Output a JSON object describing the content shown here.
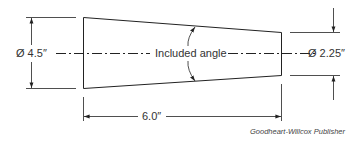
{
  "diagram": {
    "type": "taper-dimension-drawing",
    "shape": "truncated-cone-side-view",
    "labels": {
      "large_diameter": "Ø 4.5″",
      "small_diameter": "Ø 2.25″",
      "length": "6.0″",
      "included_angle": "Included angle"
    },
    "values": {
      "large_diameter_in": 4.5,
      "small_diameter_in": 2.25,
      "length_in": 6.0
    },
    "credit": "Goodheart-Willcox Publisher",
    "colors": {
      "line": "#222222",
      "text": "#333333",
      "background": "#ffffff"
    }
  }
}
